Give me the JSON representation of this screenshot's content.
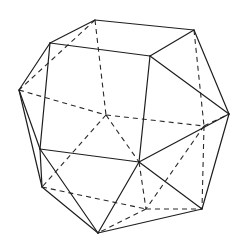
{
  "figure": {
    "background": "#ffffff",
    "stroke_color": "#1e1e1e",
    "hidden_stroke_color": "#2a2a2a",
    "vertices": {
      "T1": [
        95,
        20
      ],
      "T2": [
        194,
        30
      ],
      "A": [
        50,
        43
      ],
      "B": [
        150,
        56
      ],
      "L": [
        19,
        90
      ],
      "R": [
        229,
        114
      ],
      "C": [
        40,
        149
      ],
      "D": [
        139,
        162
      ],
      "LL": [
        42,
        187
      ],
      "LR": [
        202,
        209
      ],
      "BOT": [
        98,
        233
      ],
      "H1": [
        106,
        115
      ],
      "H2": [
        146,
        209
      ],
      "H3": [
        204,
        126
      ]
    },
    "visible_edges": [
      [
        "T1",
        "T2"
      ],
      [
        "A",
        "T1"
      ],
      [
        "A",
        "B"
      ],
      [
        "B",
        "T2"
      ],
      [
        "A",
        "C"
      ],
      [
        "B",
        "D"
      ],
      [
        "C",
        "D"
      ],
      [
        "A",
        "L"
      ],
      [
        "L",
        "C"
      ],
      [
        "L",
        "LL"
      ],
      [
        "T2",
        "R"
      ],
      [
        "B",
        "R"
      ],
      [
        "R",
        "D"
      ],
      [
        "R",
        "LR"
      ],
      [
        "C",
        "LL"
      ],
      [
        "C",
        "BOT"
      ],
      [
        "LL",
        "BOT"
      ],
      [
        "D",
        "BOT"
      ],
      [
        "D",
        "LR"
      ],
      [
        "LR",
        "BOT"
      ]
    ],
    "hidden_edges": [
      [
        "T1",
        "H1"
      ],
      [
        "L",
        "H1"
      ],
      [
        "H1",
        "H3"
      ],
      [
        "H1",
        "LL"
      ],
      [
        "H1",
        "D"
      ],
      [
        "T1",
        "L"
      ],
      [
        "T2",
        "H3"
      ],
      [
        "H3",
        "R"
      ],
      [
        "H3",
        "LR"
      ],
      [
        "H3",
        "H2"
      ],
      [
        "LL",
        "H2"
      ],
      [
        "D",
        "H2"
      ],
      [
        "H2",
        "LR"
      ],
      [
        "H2",
        "BOT"
      ]
    ]
  }
}
